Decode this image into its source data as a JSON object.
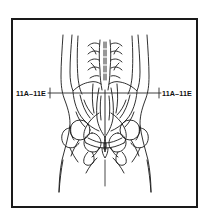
{
  "figure": {
    "type": "anatomical-line-drawing",
    "view": "posterior pelvis and lower back",
    "background_color": "#ffffff",
    "line_color": "#1a1a1a",
    "frame": {
      "border_color": "#1a1a1a",
      "border_width_px": 2,
      "x": 11,
      "y": 18,
      "width": 187,
      "height": 190
    },
    "reference_line": {
      "orientation": "horizontal",
      "y": 93,
      "x_start": 48,
      "x_end": 161,
      "color": "#2b2b2b"
    },
    "labels": {
      "left": "11A–11E",
      "right": "11A–11E"
    },
    "leader_ticks": {
      "left_x": 48,
      "right_x": 161
    }
  }
}
